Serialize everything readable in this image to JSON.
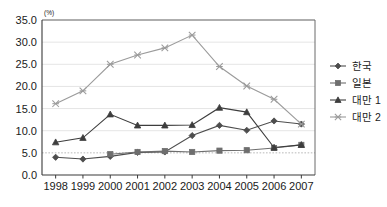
{
  "chart_data": {
    "type": "line",
    "title": "",
    "subtitle": "",
    "xlabel": "",
    "ylabel": "",
    "unit_label": "(%)",
    "categories": [
      "1998",
      "1999",
      "2000",
      "2001",
      "2002",
      "2003",
      "2004",
      "2005",
      "2006",
      "2007"
    ],
    "x": [
      1998,
      1999,
      2000,
      2001,
      2002,
      2003,
      2004,
      2005,
      2006,
      2007
    ],
    "ylim": [
      0.0,
      35.0
    ],
    "ytick_step": 5.0,
    "ytick_labels": [
      "0.0",
      "5.0",
      "10.0",
      "15.0",
      "20.0",
      "25.0",
      "30.0",
      "35.0"
    ],
    "ytick_values": [
      0.0,
      5.0,
      10.0,
      15.0,
      20.0,
      25.0,
      30.0,
      35.0
    ],
    "grid": true,
    "legend_position": "right",
    "series": [
      {
        "name": "한국",
        "marker": "diamond",
        "color": "#4d4d4d",
        "values": [
          4.0,
          3.6,
          4.2,
          5.1,
          5.2,
          8.9,
          11.2,
          10.1,
          12.2,
          11.5
        ]
      },
      {
        "name": "일본",
        "marker": "square",
        "color": "#6e6e6e",
        "values": [
          null,
          null,
          4.7,
          5.2,
          5.4,
          5.2,
          5.5,
          5.6,
          6.1,
          6.8
        ]
      },
      {
        "name": "대만1",
        "marker": "triangle",
        "color": "#3d3d3d",
        "values": [
          7.4,
          8.4,
          13.7,
          11.2,
          11.2,
          11.3,
          15.2,
          14.2,
          6.2,
          6.8
        ]
      },
      {
        "name": "대만2",
        "marker": "cross",
        "color": "#9b9b9b",
        "values": [
          16.1,
          19.0,
          25.0,
          27.1,
          28.7,
          31.6,
          24.5,
          20.1,
          17.1,
          11.5
        ]
      }
    ]
  },
  "legend": {
    "items": [
      {
        "label": "한국"
      },
      {
        "label": "일본"
      },
      {
        "label": "대만 1"
      },
      {
        "label": "대만 2"
      }
    ]
  }
}
